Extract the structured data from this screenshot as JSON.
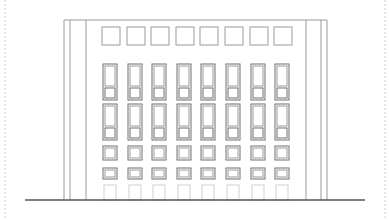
{
  "drawing": {
    "type": "building-elevation",
    "colors": {
      "line": "#9a9a9a",
      "dark_line": "#6f6f6f",
      "ground": "#555555",
      "border": "#cfcfcf",
      "background": "#ffffff"
    },
    "frame": {
      "left_x": 5,
      "right_x": 385
    },
    "building": {
      "outer_left": 64,
      "inner_left": 70,
      "body_left": 86,
      "body_right": 306,
      "inner_right": 321,
      "outer_right": 327,
      "top": 20,
      "bottom": 200
    },
    "ground": {
      "y": 200,
      "x1": 25,
      "x2": 365
    },
    "columns": 8,
    "column_start_x": 103,
    "column_pitch": 24.6,
    "top_squares": {
      "y": 27,
      "h": 18,
      "w": 18,
      "offset": -1
    },
    "window_rows": [
      {
        "name": "row-1",
        "y": 64,
        "tall_h": 23,
        "lower_h": 13,
        "w": 14
      },
      {
        "name": "row-2",
        "y": 104,
        "tall_h": 23,
        "lower_h": 13,
        "w": 14
      },
      {
        "name": "row-3",
        "y": 146,
        "h": 14,
        "w": 14
      },
      {
        "name": "row-4",
        "y": 168,
        "h": 11,
        "w": 14
      },
      {
        "name": "doors",
        "y": 185,
        "h": 15,
        "w": 14
      }
    ]
  }
}
